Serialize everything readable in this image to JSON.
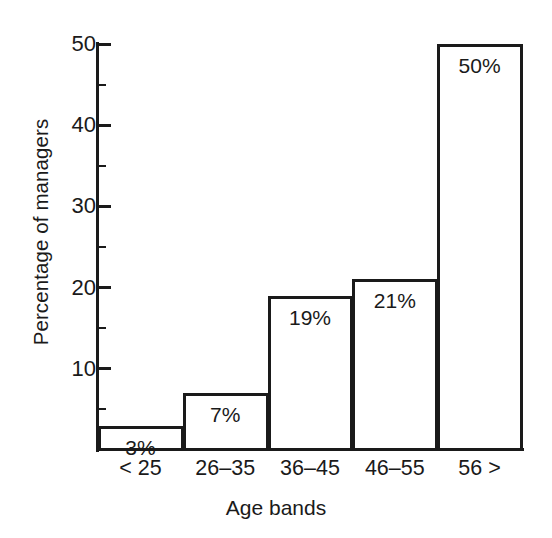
{
  "chart_data": {
    "type": "bar",
    "title": "",
    "subtitle": "",
    "xlabel": "Age bands",
    "ylabel": "Percentage of managers",
    "categories": [
      "< 25",
      "26–35",
      "36–45",
      "46–55",
      "56 >"
    ],
    "values": [
      3,
      7,
      19,
      21,
      50
    ],
    "data_labels": [
      "3%",
      "7%",
      "19%",
      "21%",
      "50%"
    ],
    "ylim": [
      0,
      50
    ],
    "xlim_note": "categorical, five adjacent bands",
    "y_ticks_major": [
      10,
      20,
      30,
      40,
      50
    ],
    "y_tick_labels": [
      "10",
      "20",
      "30",
      "40",
      "50"
    ],
    "y_ticks_minor": [
      5,
      15,
      25,
      35,
      45
    ],
    "grid": false,
    "legend": null,
    "legend_position": "none",
    "series": [
      {
        "name": "Percentage of managers",
        "values": [
          3,
          7,
          19,
          21,
          50
        ]
      }
    ],
    "colors": {
      "bar_fill": "#ffffff",
      "bar_outline": "#1a1a1a",
      "axis": "#1a1a1a",
      "text": "#1a1a1a",
      "background": "#ffffff"
    }
  }
}
